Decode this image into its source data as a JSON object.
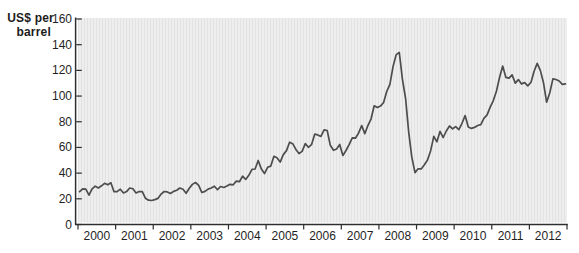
{
  "figure": {
    "y_axis_title_line1": "US$ per",
    "y_axis_title_line2": "barrel"
  },
  "colors": {
    "page_bg": "#ffffff",
    "plot_bg": "#eeeeee",
    "plot_stripe": "#e2e2e2",
    "axis": "#2e2e2e",
    "line": "#4d4d4d",
    "text": "#1f1f1f"
  },
  "chart_data": {
    "type": "line",
    "title": "",
    "ylabel": "US$ per barrel",
    "xlabel": "",
    "ylim": [
      0,
      160
    ],
    "y_ticks": [
      0,
      20,
      40,
      60,
      80,
      100,
      120,
      140,
      160
    ],
    "x_tick_labels": [
      "2000",
      "2001",
      "2002",
      "2003",
      "2004",
      "2005",
      "2006",
      "2007",
      "2008",
      "2009",
      "2010",
      "2011",
      "2012"
    ],
    "grid": false,
    "legend_position": "none",
    "frequency": "monthly",
    "x_start_year": 2000,
    "series": [
      {
        "name": "Crude oil spot price",
        "values": [
          25.5,
          27.8,
          27.5,
          22.8,
          27.7,
          29.8,
          28.4,
          30.1,
          32.1,
          30.9,
          32.5,
          25.5,
          25.6,
          27.5,
          24.5,
          25.6,
          28.4,
          27.8,
          24.6,
          25.7,
          25.6,
          20.5,
          18.9,
          18.7,
          19.4,
          20.3,
          23.7,
          25.7,
          25.4,
          24.1,
          25.8,
          26.6,
          28.4,
          27.5,
          24.3,
          28.2,
          31.2,
          32.7,
          30.5,
          24.9,
          25.8,
          27.6,
          28.4,
          29.8,
          27.1,
          29.6,
          28.8,
          29.9,
          31.3,
          30.9,
          33.8,
          33.3,
          37.6,
          35.1,
          38.3,
          43.0,
          43.2,
          49.8,
          43.1,
          39.6,
          44.5,
          45.5,
          53.1,
          51.9,
          48.6,
          54.4,
          57.5,
          64.1,
          62.9,
          58.5,
          55.2,
          56.9,
          63.0,
          60.1,
          62.1,
          70.3,
          69.8,
          68.6,
          73.7,
          73.2,
          61.7,
          57.8,
          58.9,
          62.3,
          53.7,
          57.6,
          62.1,
          67.5,
          67.2,
          71.1,
          77.0,
          70.8,
          77.2,
          82.3,
          92.4,
          91.0,
          92.2,
          95.0,
          103.7,
          109.1,
          122.8,
          132.3,
          133.9,
          113.2,
          98.1,
          71.9,
          52.5,
          40.4,
          43.4,
          43.3,
          46.5,
          50.2,
          57.3,
          68.6,
          64.4,
          72.5,
          67.7,
          72.8,
          76.7,
          74.5,
          76.2,
          73.8,
          78.8,
          84.8,
          75.9,
          74.8,
          75.6,
          77.1,
          77.8,
          82.7,
          85.3,
          91.4,
          96.5,
          104.0,
          114.6,
          123.3,
          114.5,
          114.0,
          116.5,
          110.1,
          112.8,
          109.5,
          110.5,
          107.9,
          110.7,
          119.3,
          125.4,
          119.8,
          110.3,
          95.2,
          102.6,
          113.4,
          112.9,
          111.7,
          109.1,
          109.5
        ]
      }
    ]
  }
}
